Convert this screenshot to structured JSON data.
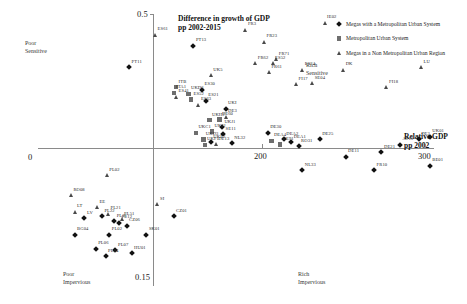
{
  "chart_data": {
    "type": "scatter",
    "title": "Difference in growth of GDP pp 2002-2015",
    "xlabel": "Relative GDP pp 2002",
    "ylabel": "Difference in growth of GDP pp 2002-2015",
    "xlim": [
      0,
      320
    ],
    "ylim": [
      -0.15,
      0.5
    ],
    "xticks": [
      "0",
      "200",
      "300"
    ],
    "yticks": [
      "0.5",
      "0.15"
    ],
    "grid": false,
    "legend_position": "top-right",
    "quadrant_labels": [
      "Poor Sensitive",
      "Rich Sensitive",
      "Poor Impervious",
      "Rich Impervious"
    ],
    "series": [
      {
        "name": "Megas with a Metropolitan Urban System",
        "marker": "diamond",
        "points": [
          {
            "label": "PT13",
            "x": 126,
            "y": 0.38
          },
          {
            "label": "PT11",
            "x": 74,
            "y": 0.3
          },
          {
            "label": "ES30",
            "x": 133,
            "y": 0.215
          },
          {
            "label": "ES21",
            "x": 136,
            "y": 0.175
          },
          {
            "label": "UKI",
            "x": 152,
            "y": 0.145
          },
          {
            "label": "UKJ1",
            "x": 149,
            "y": 0.075
          },
          {
            "label": "SE11",
            "x": 150,
            "y": 0.05
          },
          {
            "label": "UKE2",
            "x": 140,
            "y": 0.02
          },
          {
            "label": "NL32",
            "x": 157,
            "y": 0.015
          },
          {
            "label": "DE30",
            "x": 186,
            "y": 0.055
          },
          {
            "label": "DEA1",
            "x": 205,
            "y": 0.02
          },
          {
            "label": "RO31",
            "x": 211,
            "y": 0.005
          },
          {
            "label": "NL33",
            "x": 214,
            "y": -0.025
          },
          {
            "label": "DE11",
            "x": 249,
            "y": -0.01
          },
          {
            "label": "DE21",
            "x": 278,
            "y": -0.005
          },
          {
            "label": "AT13",
            "x": 293,
            "y": 0.01
          },
          {
            "label": "DE3",
            "x": 308,
            "y": 0.03
          },
          {
            "label": "BE01",
            "x": 317,
            "y": -0.02
          },
          {
            "label": "UK01",
            "x": 317,
            "y": 0.04
          },
          {
            "label": "FR10",
            "x": 272,
            "y": -0.025
          },
          {
            "label": "DE25",
            "x": 228,
            "y": 0.03
          },
          {
            "label": "DEA2",
            "x": 199,
            "y": 0.03
          },
          {
            "label": "CZ01",
            "x": 110,
            "y": -0.075
          },
          {
            "label": "SK01",
            "x": 88,
            "y": -0.095
          },
          {
            "label": "HU01",
            "x": 76,
            "y": -0.115
          },
          {
            "label": "PL07",
            "x": 63,
            "y": -0.112
          },
          {
            "label": "PL06",
            "x": 47,
            "y": -0.11
          },
          {
            "label": "PL04",
            "x": 55,
            "y": -0.118
          },
          {
            "label": "PL02",
            "x": 58,
            "y": -0.095
          },
          {
            "label": "BG04",
            "x": 30,
            "y": -0.095
          },
          {
            "label": "PL12",
            "x": 66,
            "y": -0.082
          },
          {
            "label": "CZ06",
            "x": 72,
            "y": -0.085
          },
          {
            "label": "PL31",
            "x": 62,
            "y": -0.08
          },
          {
            "label": "LV",
            "x": 38,
            "y": -0.077
          },
          {
            "label": "PL22",
            "x": 52,
            "y": -0.075
          }
        ]
      },
      {
        "name": "Metropolitan Urban System",
        "marker": "square",
        "points": [
          {
            "label": "DE60",
            "x": 147,
            "y": 0.105
          },
          {
            "label": "UKH2",
            "x": 139,
            "y": 0.102
          },
          {
            "label": "UKJ2",
            "x": 141,
            "y": 0.06
          },
          {
            "label": "UKC1",
            "x": 128,
            "y": 0.055
          },
          {
            "label": "ITB",
            "x": 112,
            "y": 0.225
          },
          {
            "label": "ITA1",
            "x": 110,
            "y": 0.205
          },
          {
            "label": "UKD6",
            "x": 122,
            "y": 0.2
          },
          {
            "label": "ES52",
            "x": 124,
            "y": 0.18
          },
          {
            "label": "UKD3",
            "x": 134,
            "y": 0.03
          },
          {
            "label": "DEA4",
            "x": 189,
            "y": 0.025
          },
          {
            "label": "DE91",
            "x": 196,
            "y": 0.012
          },
          {
            "label": "UKF1",
            "x": 135,
            "y": 0.01
          }
        ]
      },
      {
        "name": "Megas in a Non Metropolitan Urban Region",
        "marker": "triangle",
        "points": [
          {
            "label": "ES61",
            "x": 95,
            "y": 0.42
          },
          {
            "label": "FR3",
            "x": 168,
            "y": 0.44
          },
          {
            "label": "IE02",
            "x": 232,
            "y": 0.465
          },
          {
            "label": "FR23",
            "x": 183,
            "y": 0.395
          },
          {
            "label": "FR71",
            "x": 193,
            "y": 0.33
          },
          {
            "label": "FR62",
            "x": 176,
            "y": 0.315
          },
          {
            "label": "ES52",
            "x": 190,
            "y": 0.315
          },
          {
            "label": "ES24",
            "x": 214,
            "y": 0.29
          },
          {
            "label": "FR61",
            "x": 187,
            "y": 0.28
          },
          {
            "label": "FI17",
            "x": 209,
            "y": 0.235
          },
          {
            "label": "SE04",
            "x": 222,
            "y": 0.24
          },
          {
            "label": "DK",
            "x": 247,
            "y": 0.29
          },
          {
            "label": "FI18",
            "x": 282,
            "y": 0.225
          },
          {
            "label": "LU",
            "x": 310,
            "y": 0.3
          },
          {
            "label": "UK5",
            "x": 140,
            "y": 0.27
          },
          {
            "label": "ES63",
            "x": 130,
            "y": 0.16
          },
          {
            "label": "PL02",
            "x": 56,
            "y": -0.03
          },
          {
            "label": "ES41",
            "x": 112,
            "y": 0.19
          },
          {
            "label": "DE3",
            "x": 152,
            "y": 0.115
          },
          {
            "label": "RO08",
            "x": 27,
            "y": -0.052
          },
          {
            "label": "LT",
            "x": 30,
            "y": -0.07
          },
          {
            "label": "EE",
            "x": 48,
            "y": -0.065
          },
          {
            "label": "SI",
            "x": 97,
            "y": -0.062
          },
          {
            "label": "PL21",
            "x": 57,
            "y": -0.072
          },
          {
            "label": "PL51",
            "x": 68,
            "y": -0.078
          },
          {
            "label": "DE13",
            "x": 144,
            "y": 0.012
          }
        ]
      }
    ]
  },
  "legend": {
    "items": [
      {
        "marker": "diamond",
        "label": "Megas with a Metropolitan Urban System"
      },
      {
        "marker": "square",
        "label": "Metropolitan Urban System"
      },
      {
        "marker": "triangle",
        "label": "Megas in a Non Metropolitan Urban Region"
      }
    ]
  }
}
